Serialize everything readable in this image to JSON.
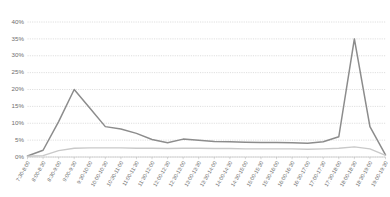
{
  "chart_data": {
    "type": "line",
    "title": "",
    "subtitle": "",
    "xlabel": "",
    "ylabel": "",
    "ylim": [
      0,
      40
    ],
    "ytick_labels": [
      "0%",
      "5%",
      "10%",
      "15%",
      "20%",
      "25%",
      "30%",
      "35%",
      "40%"
    ],
    "ytick_values": [
      0,
      5,
      10,
      15,
      20,
      25,
      30,
      35,
      40
    ],
    "grid": true,
    "legend": "none",
    "value_unit": "%",
    "categories": [
      "7:30-8:00",
      "8:00-8:30",
      "8:30-9:00",
      "9:00-9:30",
      "9:30-10:00",
      "10:00-10:30",
      "10:30-11:00",
      "11:00-11:30",
      "11:30-12:00",
      "12:00-12:30",
      "12:30-13:00",
      "13:00-13:30",
      "13:30-14:00",
      "14:00-14:30",
      "14:30-15:00",
      "15:00-15:30",
      "15:30-16:00",
      "16:00-16:30",
      "16:30-17:00",
      "17:00-17:30",
      "17:30-18:00",
      "18:00-18:30",
      "18:30-19:00",
      "19:00-19:30"
    ],
    "series": [
      {
        "name": "series-primary",
        "color": "#8c8c8c",
        "width": 1.5,
        "values": [
          0.3,
          2.0,
          10.5,
          20.0,
          14.5,
          9.0,
          8.3,
          7.0,
          5.2,
          4.2,
          5.3,
          5.0,
          4.6,
          4.5,
          4.4,
          4.3,
          4.3,
          4.2,
          4.1,
          4.5,
          6.0,
          35.0,
          9.0,
          0.6
        ]
      },
      {
        "name": "series-secondary",
        "color": "#c9c9c9",
        "width": 1.4,
        "values": [
          0.2,
          0.4,
          1.9,
          2.6,
          2.7,
          2.7,
          2.7,
          2.6,
          2.6,
          2.5,
          2.6,
          2.6,
          2.5,
          2.5,
          2.4,
          2.4,
          2.4,
          2.4,
          2.3,
          2.4,
          2.6,
          3.0,
          2.4,
          0.5
        ]
      }
    ]
  }
}
